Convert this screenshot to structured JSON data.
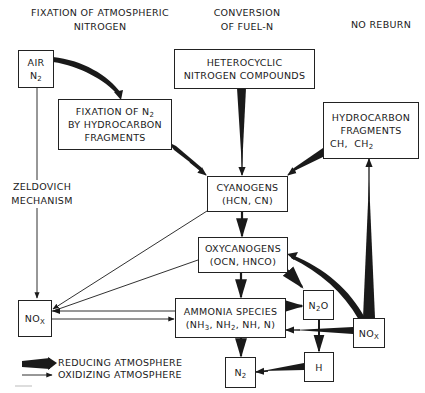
{
  "headers": {
    "left_line1": "FIXATION OF ATMOSPHERIC",
    "left_line2": "NITROGEN",
    "center_line1": "CONVERSION",
    "center_line2": "OF FUEL-N",
    "right": "NO REBURN"
  },
  "nodes": {
    "air": {
      "line1": "AIR",
      "line2_main": "N",
      "line2_sub": "2"
    },
    "heterocyclic": {
      "line1": "HETEROCYCLIC",
      "line2": "NITROGEN COMPOUNDS"
    },
    "fixation": {
      "line1_main": "FIXATION OF N",
      "line1_sub": "2",
      "line2": "BY HYDROCARBON",
      "line3": "FRAGMENTS"
    },
    "hydrocarbon": {
      "line1": "HYDROCARBON",
      "line2": "FRAGMENTS",
      "line3_a": "CH,",
      "line3_b_main": "CH",
      "line3_b_sub": "2"
    },
    "cyanogens": {
      "line1": "CYANOGENS",
      "line2": "(HCN, CN)"
    },
    "oxycanogens": {
      "line1": "OXYCANOGENS",
      "line2": "(OCN, HNCO)"
    },
    "nox_left": {
      "main": "NO",
      "sub": "X"
    },
    "ammonia": {
      "line1": "AMMONIA SPECIES",
      "line2_a": "(NH",
      "line2_sub1": "3",
      "line2_b": ", NH",
      "line2_sub2": "2",
      "line2_c": ", NH, N)"
    },
    "n2o": {
      "a": "N",
      "sub": "2",
      "b": "O"
    },
    "nox_right": {
      "main": "NO",
      "sub": "X"
    },
    "n2": {
      "main": "N",
      "sub": "2"
    },
    "h": {
      "label": "H"
    }
  },
  "side_label": {
    "line1": "ZELDOVICH",
    "line2": "MECHANISM"
  },
  "legend": {
    "reducing": "REDUCING ATMOSPHERE",
    "oxidizing": "OXIDIZING ATMOSPHERE"
  },
  "colors": {
    "ink": "#1a1a1a",
    "background": "#ffffff"
  }
}
